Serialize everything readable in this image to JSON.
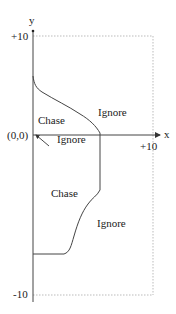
{
  "diagram": {
    "axes": {
      "x_label": "x",
      "y_label": "y",
      "origin_label": "(0,0)",
      "x_max_label": "+10",
      "y_max_label": "+10",
      "y_min_label": "-10"
    },
    "regions": [
      {
        "label": "Chase",
        "side": "upper-left"
      },
      {
        "label": "Ignore",
        "side": "upper-right"
      },
      {
        "label": "Ignore",
        "side": "near-origin",
        "pointer": true
      },
      {
        "label": "Chase",
        "side": "lower-left"
      },
      {
        "label": "Ignore",
        "side": "lower-right"
      }
    ],
    "colors": {
      "line": "#333333",
      "dotted": "#bbbbbb",
      "text": "#222222"
    }
  }
}
